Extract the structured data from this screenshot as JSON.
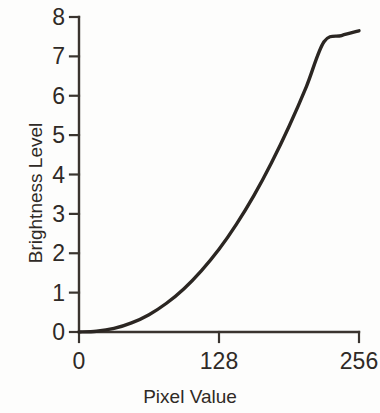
{
  "chart_data": {
    "type": "line",
    "title": "",
    "subtitle": "",
    "xlabel": "Pixel Value",
    "ylabel": "Brightness Level",
    "xlim": [
      0,
      256
    ],
    "ylim": [
      0,
      8
    ],
    "xticks": [
      0,
      128,
      256
    ],
    "xtick_labels": [
      "0",
      "128",
      "256"
    ],
    "yticks": [
      0,
      1,
      2,
      3,
      4,
      5,
      6,
      7,
      8
    ],
    "ytick_labels": [
      "0",
      "1",
      "2",
      "3",
      "4",
      "5",
      "6",
      "7",
      "8"
    ],
    "grid": false,
    "legend": null,
    "annotations": [],
    "line_color": "#2b2622",
    "line_width": 3.4,
    "axis_color": "#3a342f",
    "background_color": "#fdfdfc",
    "series": [
      {
        "name": "Brightness response (gamma curve)",
        "x": [
          0,
          16,
          32,
          48,
          64,
          80,
          96,
          112,
          128,
          144,
          160,
          176,
          192,
          208,
          224,
          240,
          256
        ],
        "y": [
          0.0,
          0.02,
          0.09,
          0.23,
          0.44,
          0.73,
          1.1,
          1.56,
          2.1,
          2.74,
          3.47,
          4.3,
          5.22,
          6.24,
          7.37,
          7.53,
          7.65
        ]
      }
    ]
  },
  "axis_titles": {
    "x": "Pixel Value",
    "y": "Brightness Level"
  }
}
